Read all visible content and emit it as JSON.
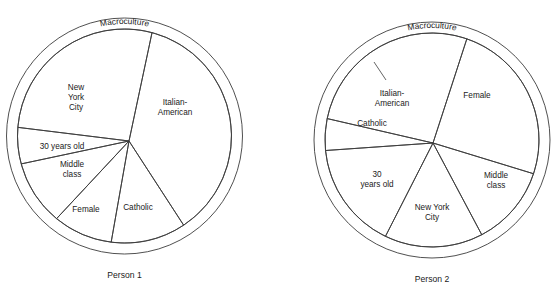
{
  "figure": {
    "background_color": "#ffffff",
    "line_color": "#3c3c3c",
    "text_color": "#1a1a1a"
  },
  "diagrams": [
    {
      "id": "person-1",
      "caption": "Person 1",
      "ring_label": "Macroculture",
      "center": {
        "x": 129,
        "y": 141
      },
      "circle_center": {
        "x": 124.5,
        "y": 136
      },
      "outer_radius": 118,
      "inner_radius": 107,
      "slices": [
        {
          "name": "italian-american",
          "label": "Italian-\nAmerican",
          "start_deg": -78,
          "end_deg": 57,
          "label_x": 175,
          "label_y": 108
        },
        {
          "name": "catholic",
          "label": "Catholic",
          "start_deg": 57,
          "end_deg": 100,
          "label_x": 138,
          "label_y": 208
        },
        {
          "name": "female",
          "label": "Female",
          "start_deg": 100,
          "end_deg": 133,
          "label_x": 86,
          "label_y": 210
        },
        {
          "name": "middle-class",
          "label": "Middle\nclass",
          "start_deg": 133,
          "end_deg": 168,
          "label_x": 72,
          "label_y": 170
        },
        {
          "name": "30-years-old",
          "label": "30 years old",
          "start_deg": 168,
          "end_deg": 187,
          "label_x": 62,
          "label_y": 147
        },
        {
          "name": "new-york-city",
          "label": "New\nYork\nCity",
          "start_deg": 187,
          "end_deg": 282,
          "label_x": 76,
          "label_y": 98
        }
      ]
    },
    {
      "id": "person-2",
      "caption": "Person 2",
      "ring_label": "Macroculture",
      "center": {
        "x": 433,
        "y": 143
      },
      "circle_center": {
        "x": 432,
        "y": 140
      },
      "outer_radius": 118,
      "inner_radius": 107,
      "slices": [
        {
          "name": "female",
          "label": "Female",
          "start_deg": -72,
          "end_deg": 17,
          "label_x": 477,
          "label_y": 96
        },
        {
          "name": "middle-class",
          "label": "Middle\nclass",
          "start_deg": 17,
          "end_deg": 62,
          "label_x": 496,
          "label_y": 181
        },
        {
          "name": "new-york-city",
          "label": "New York\nCity",
          "start_deg": 62,
          "end_deg": 117,
          "label_x": 432,
          "label_y": 213
        },
        {
          "name": "30-years-old",
          "label": "30\nyears old",
          "start_deg": 117,
          "end_deg": 176,
          "label_x": 377,
          "label_y": 180
        },
        {
          "name": "catholic",
          "label": "Catholic",
          "start_deg": 176,
          "end_deg": 193,
          "label_x": 372,
          "label_y": 124
        },
        {
          "name": "italian-american",
          "label": "Italian-\nAmerican",
          "start_deg": 193,
          "end_deg": 288,
          "label_x": 392,
          "label_y": 99,
          "leader": {
            "x1": 386,
            "y1": 80,
            "x2": 374,
            "y2": 62
          }
        }
      ]
    }
  ]
}
